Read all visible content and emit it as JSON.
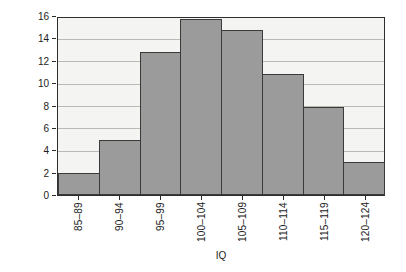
{
  "chart_data": {
    "type": "bar",
    "title": "",
    "xlabel": "IQ",
    "ylabel": "Number of students",
    "categories": [
      "85–89",
      "90–94",
      "95–99",
      "100–104",
      "105–109",
      "110–114",
      "115–119",
      "120–124"
    ],
    "values": [
      2,
      5,
      13,
      16,
      15,
      11,
      8,
      3
    ],
    "ylim": [
      0,
      16
    ],
    "yticks": [
      0,
      2,
      4,
      6,
      8,
      10,
      12,
      14,
      16
    ],
    "ytick_labels": [
      "0",
      "2",
      "4",
      "6",
      "8",
      "10",
      "12",
      "14",
      "16"
    ],
    "grid": true,
    "legend": false,
    "colors": {
      "bar_fill": "#9b9b9b",
      "bar_edge": "#3a3a3a",
      "plot_background": "#f4f4f2",
      "gridline": "#b9b9b5",
      "axis": "#2e2e2e",
      "text": "#1c1c1c"
    }
  }
}
